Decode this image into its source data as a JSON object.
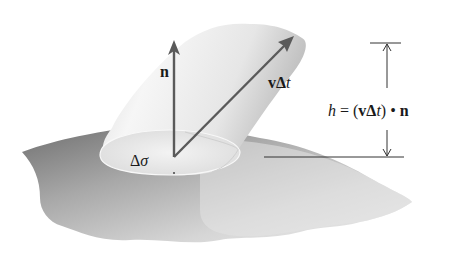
{
  "figure": {
    "labels": {
      "normal": "n",
      "velocity_v": "v",
      "velocity_delta": "Δ",
      "velocity_t": "t",
      "area_delta": "Δ",
      "area_sigma": "σ",
      "height_h": "h",
      "height_eq": " = (",
      "height_v": "v",
      "height_delta": "Δ",
      "height_t": "t",
      "height_close": ")",
      "height_dot": " • ",
      "height_n": "n"
    },
    "colors": {
      "arrow": "#555555",
      "surface_dark": "#6e6e6e",
      "surface_light": "#e2e2e2",
      "cylinder_light": "#f4f4f4",
      "cylinder_dark": "#bdbdbd",
      "line": "#333333"
    }
  }
}
